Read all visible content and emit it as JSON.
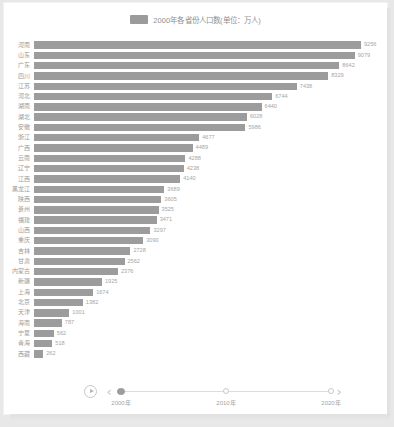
{
  "legend": {
    "label": "2000年各省份人口数(单位：万人)",
    "swatch_color": "#9b9b9b",
    "icon": "legend-swatch-icon"
  },
  "timeline": {
    "play_icon": "play-icon",
    "prev_icon": "chevron-left-icon",
    "next_icon": "chevron-right-icon",
    "ticks": [
      "2000年",
      "2010年",
      "2020年"
    ],
    "selected": "2000年",
    "nodes": 3
  },
  "chart_data": {
    "type": "bar",
    "orientation": "horizontal",
    "title": "2000年各省份人口数(单位：万人)",
    "xlabel": "",
    "ylabel": "",
    "grid": false,
    "legend_position": "top-center",
    "xlim": [
      0,
      9256
    ],
    "bar_color": "#9c9c9c",
    "categories": [
      "河南",
      "山东",
      "广东",
      "四川",
      "江苏",
      "河北",
      "湖南",
      "湖北",
      "安徽",
      "浙江",
      "广西",
      "云南",
      "辽宁",
      "江西",
      "黑龙江",
      "陕西",
      "贵州",
      "福建",
      "山西",
      "重庆",
      "吉林",
      "甘肃",
      "内蒙古",
      "新疆",
      "上海",
      "北京",
      "天津",
      "海南",
      "宁夏",
      "青海",
      "西藏"
    ],
    "values": [
      9256,
      9079,
      8642,
      8329,
      7438,
      6744,
      6440,
      6028,
      5986,
      4677,
      4489,
      4288,
      4238,
      4140,
      3689,
      3605,
      3525,
      3471,
      3297,
      3090,
      2728,
      2562,
      2376,
      1925,
      1674,
      1382,
      1001,
      787,
      562,
      518,
      262
    ]
  }
}
